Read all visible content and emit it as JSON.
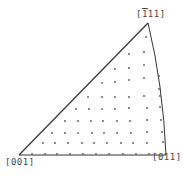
{
  "diagram": {
    "type": "stereographic-triangle",
    "line_color": "#333333",
    "dot_color": "#555555",
    "vertices": {
      "bottom_left": {
        "label": "[001]",
        "x": 19,
        "y": 155
      },
      "bottom_right": {
        "label": "[011]",
        "x": 166,
        "y": 155
      },
      "top": {
        "label": "[̅1 11]",
        "label_display": "[111]",
        "bar_over_first": true,
        "x": 148,
        "y": 23
      }
    },
    "labels": {
      "v001": "[001]",
      "v011": "[011]",
      "v111_prefix": "[",
      "v111_bar": "1",
      "v111_rest": "11]"
    },
    "dots": [
      [
        32,
        154
      ],
      [
        45,
        154
      ],
      [
        57,
        154
      ],
      [
        70,
        154
      ],
      [
        83,
        154
      ],
      [
        96,
        154
      ],
      [
        109,
        154
      ],
      [
        123,
        154
      ],
      [
        136,
        154
      ],
      [
        149,
        154
      ],
      [
        43,
        143
      ],
      [
        55,
        143
      ],
      [
        68,
        143
      ],
      [
        82,
        143
      ],
      [
        94,
        143
      ],
      [
        107,
        143
      ],
      [
        121,
        143
      ],
      [
        133,
        143
      ],
      [
        147,
        143
      ],
      [
        163,
        142
      ],
      [
        52,
        133
      ],
      [
        65,
        133
      ],
      [
        78,
        133
      ],
      [
        92,
        133
      ],
      [
        104,
        133
      ],
      [
        117,
        133
      ],
      [
        131,
        133
      ],
      [
        147,
        132
      ],
      [
        162,
        132
      ],
      [
        65,
        121
      ],
      [
        78,
        121
      ],
      [
        91,
        121
      ],
      [
        103,
        121
      ],
      [
        117,
        121
      ],
      [
        130,
        121
      ],
      [
        147,
        120
      ],
      [
        161,
        120
      ],
      [
        76,
        109
      ],
      [
        89,
        109
      ],
      [
        102,
        109
      ],
      [
        115,
        109
      ],
      [
        129,
        108
      ],
      [
        147,
        108
      ],
      [
        160,
        107
      ],
      [
        88,
        97
      ],
      [
        102,
        97
      ],
      [
        115,
        97
      ],
      [
        129,
        97
      ],
      [
        144,
        96
      ],
      [
        160,
        96
      ],
      [
        159,
        89
      ],
      [
        102,
        83
      ],
      [
        115,
        82
      ],
      [
        129,
        80
      ],
      [
        144,
        78
      ],
      [
        159,
        76
      ],
      [
        115,
        69
      ],
      [
        129,
        68
      ],
      [
        144,
        65
      ],
      [
        129,
        54
      ],
      [
        144,
        52
      ],
      [
        146,
        37
      ]
    ]
  }
}
